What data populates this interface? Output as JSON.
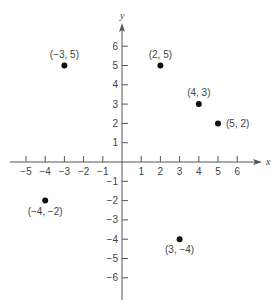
{
  "chart_data": {
    "type": "scatter",
    "title": "",
    "xlabel": "x",
    "ylabel": "y",
    "xlim": [
      -5,
      6
    ],
    "ylim": [
      -6,
      6
    ],
    "grid": false,
    "x_ticks": [
      -5,
      -4,
      -3,
      -2,
      -1,
      1,
      2,
      3,
      4,
      5,
      6
    ],
    "y_ticks": [
      6,
      5,
      4,
      3,
      2,
      1,
      -1,
      -2,
      -3,
      -4,
      -5,
      -6
    ],
    "points": [
      {
        "x": -3,
        "y": 5,
        "label": "(−3, 5)",
        "label_pos": "above"
      },
      {
        "x": 2,
        "y": 5,
        "label": "(2, 5)",
        "label_pos": "above"
      },
      {
        "x": 4,
        "y": 3,
        "label": "(4, 3)",
        "label_pos": "above"
      },
      {
        "x": 5,
        "y": 2,
        "label": "(5, 2)",
        "label_pos": "right"
      },
      {
        "x": -4,
        "y": -2,
        "label": "(−4, −2)",
        "label_pos": "below"
      },
      {
        "x": 3,
        "y": -4,
        "label": "(3, −4)",
        "label_pos": "below"
      }
    ]
  },
  "colors": {
    "axis": "#555555",
    "point": "#111111",
    "text": "#444444"
  }
}
